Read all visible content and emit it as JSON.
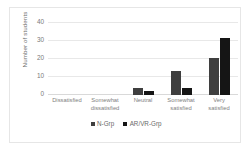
{
  "chart_data": {
    "type": "bar",
    "title": "",
    "xlabel": "",
    "ylabel": "Number of students",
    "ylim": [
      0,
      40
    ],
    "yticks": [
      40,
      30,
      20,
      10,
      0
    ],
    "grid": true,
    "legend_position": "bottom",
    "categories": [
      "Dissatisfied",
      "Somewhat dissatisfied",
      "Neutral",
      "Somewhat satisfied",
      "Very satisfied"
    ],
    "category_lines": [
      [
        "Dissatisfied"
      ],
      [
        "Somewhat",
        "dissatisfied"
      ],
      [
        "Neutral"
      ],
      [
        "Somewhat",
        "satisfied"
      ],
      [
        "Very",
        "satisfied"
      ]
    ],
    "series": [
      {
        "name": "N-Grp",
        "color": "#3f3f3f",
        "values": [
          0,
          0,
          4,
          13,
          20.5
        ]
      },
      {
        "name": "AR/VR-Grp",
        "color": "#151515",
        "values": [
          0,
          0,
          2,
          4,
          31
        ]
      }
    ]
  }
}
